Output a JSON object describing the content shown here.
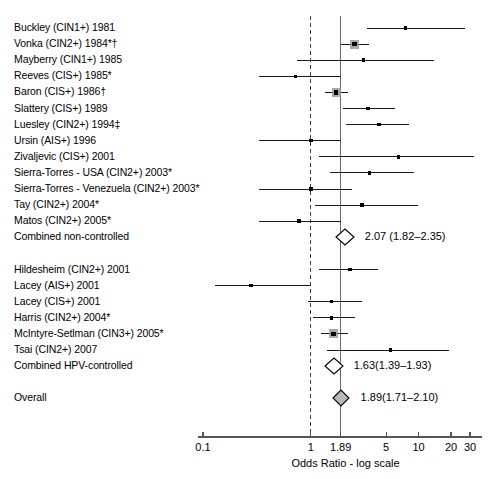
{
  "chart_data": {
    "type": "forest",
    "title": "",
    "xlabel": "Odds Ratio - log scale",
    "xscale": "log",
    "xlim": [
      0.1,
      30
    ],
    "ticks": [
      {
        "value": 0.1,
        "label": "0.1"
      },
      {
        "value": 1,
        "label": "1"
      },
      {
        "value": 1.89,
        "label": "1.89"
      },
      {
        "value": 5,
        "label": "5"
      },
      {
        "value": 10,
        "label": "10"
      },
      {
        "value": 20,
        "label": "20"
      },
      {
        "value": 30,
        "label": "30"
      }
    ],
    "reference_lines": [
      {
        "value": 1,
        "style": "dashed",
        "name": "null-line"
      },
      {
        "value": 1.89,
        "style": "solid",
        "name": "overall-line"
      }
    ],
    "groups": [
      {
        "name": "non-controlled",
        "studies": [
          {
            "label": "Buckley (CIN1+) 1981",
            "or": 7.6,
            "low": 3.3,
            "high": 27.0,
            "weighted": false
          },
          {
            "label": "Vonka (CIN2+) 1984*†",
            "or": 2.55,
            "low": 1.9,
            "high": 3.5,
            "weighted": true
          },
          {
            "label": "Mayberry (CIN1+) 1985",
            "or": 3.1,
            "low": 0.75,
            "high": 14.0,
            "weighted": false
          },
          {
            "label": "Reeves (CIS+) 1985*",
            "or": 0.72,
            "low": 0.33,
            "high": 1.9,
            "weighted": false
          },
          {
            "label": "Baron (CIS+) 1986†",
            "or": 1.72,
            "low": 1.35,
            "high": 2.2,
            "weighted": true
          },
          {
            "label": "Slattery (CIS+) 1989",
            "or": 3.4,
            "low": 2.0,
            "high": 6.0,
            "weighted": false
          },
          {
            "label": "Luesley (CIN2+) 1994‡",
            "or": 4.3,
            "low": 2.1,
            "high": 8.2,
            "weighted": false
          },
          {
            "label": "Ursin (AIS+) 1996",
            "or": 1.0,
            "low": 0.33,
            "high": 1.9,
            "weighted": false
          },
          {
            "label": "Zivaljevic (CIS+) 2001",
            "or": 6.5,
            "low": 1.2,
            "high": 33.0,
            "weighted": false
          },
          {
            "label": "Sierra-Torres - USA (CIN2+) 2003*",
            "or": 3.5,
            "low": 1.5,
            "high": 9.0,
            "weighted": false
          },
          {
            "label": "Sierra-Torres - Venezuela (CIN2+) 2003*",
            "or": 1.0,
            "low": 0.33,
            "high": 2.4,
            "weighted": false
          },
          {
            "label": "Tay (CIN2+) 2004*",
            "or": 3.0,
            "low": 1.1,
            "high": 10.0,
            "weighted": false
          },
          {
            "label": "Matos (CIN2+) 2005*",
            "or": 0.78,
            "low": 0.33,
            "high": 1.9,
            "weighted": false
          }
        ],
        "summary": {
          "label": "Combined non-controlled",
          "or": 2.07,
          "low": 1.82,
          "high": 2.35,
          "text": "2.07 (1.82–2.35)"
        }
      },
      {
        "name": "hpv-controlled",
        "studies": [
          {
            "label": "Hildesheim (CIN2+) 2001",
            "or": 2.3,
            "low": 1.2,
            "high": 4.2,
            "weighted": false
          },
          {
            "label": "Lacey (AIS+) 2001",
            "or": 0.28,
            "low": 0.13,
            "high": 1.0,
            "weighted": false
          },
          {
            "label": "Lacey (CIS+) 2001",
            "or": 1.55,
            "low": 0.95,
            "high": 3.0,
            "weighted": false
          },
          {
            "label": "Harris (CIN2+) 2004*",
            "or": 1.55,
            "low": 1.05,
            "high": 2.6,
            "weighted": false
          },
          {
            "label": "McIntyre-Setlman (CIN3+) 2005*",
            "or": 1.62,
            "low": 1.25,
            "high": 2.2,
            "weighted": true
          },
          {
            "label": "Tsai (CIN2+) 2007",
            "or": 5.5,
            "low": 1.4,
            "high": 19.0,
            "weighted": false
          }
        ],
        "summary": {
          "label": "Combined HPV-controlled",
          "or": 1.63,
          "low": 1.39,
          "high": 1.93,
          "text": "1.63(1.39–1.93)"
        }
      }
    ],
    "overall": {
      "label": "Overall",
      "or": 1.89,
      "low": 1.71,
      "high": 2.1,
      "text": "1.89(1.71–2.10)"
    }
  },
  "figure": {
    "caption": ""
  },
  "colors": {
    "line": "#000000",
    "marker": "#000000",
    "weight_box": "#9a9a9a",
    "axis": "#555555"
  }
}
